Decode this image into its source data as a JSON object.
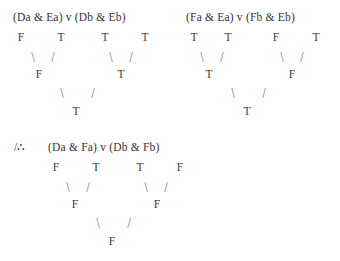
{
  "diagram": {
    "title_type": "truth-value-assignment-trees",
    "background_color": "#ffffff",
    "text_color": "#3a3a42",
    "symbols": {
      "conjunction": "&",
      "disjunction": "v",
      "therefore": "/∴",
      "branch_left": "\\",
      "branch_right": "/"
    }
  },
  "premise1": {
    "label": "premise-1",
    "formula": "(Da & Ea) v (Db & Eb)",
    "leaf_values": [
      "F",
      "T",
      "T",
      "T"
    ],
    "mid_values": [
      "F",
      "T"
    ],
    "root_value": "T"
  },
  "premise2": {
    "label": "premise-2",
    "formula": "(Fa & Ea) v (Fb & Eb)",
    "leaf_values": [
      "T",
      "T",
      "F",
      "T"
    ],
    "mid_values": [
      "T",
      "F"
    ],
    "root_value": "T"
  },
  "conclusion": {
    "label": "conclusion",
    "marker": "/∴",
    "formula": "(Da & Fa) v (Db & Fb)",
    "leaf_values": [
      "F",
      "T",
      "T",
      "F"
    ],
    "mid_values": [
      "F",
      "F"
    ],
    "root_value": "F"
  }
}
